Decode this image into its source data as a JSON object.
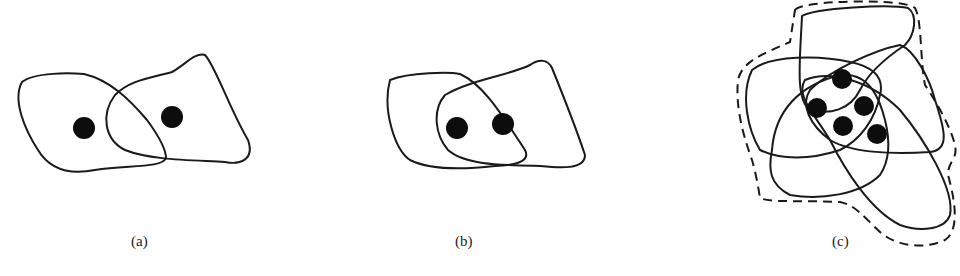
{
  "figure": {
    "panels": [
      {
        "id": "a",
        "label": "(a)",
        "description": "Two overlapping closed regions, each containing one point",
        "regions": 2,
        "points": 2
      },
      {
        "id": "b",
        "label": "(b)",
        "description": "Two overlapping closed regions, both points inside the intersection",
        "regions": 2,
        "points": 2
      },
      {
        "id": "c",
        "label": "(c)",
        "description": "Many overlapping closed regions around a cluster of five points, enclosed by a dashed outer boundary",
        "regions": 5,
        "points": 5,
        "outer_boundary": "dashed"
      }
    ]
  }
}
